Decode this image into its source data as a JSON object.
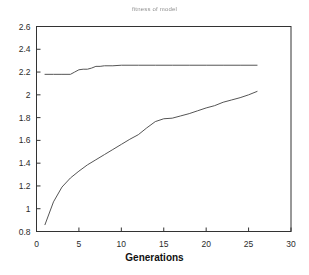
{
  "chart_data": {
    "type": "line",
    "title": "fitness of model",
    "xlabel": "Generations",
    "ylabel": "",
    "xlim": [
      0,
      30
    ],
    "ylim": [
      0.8,
      2.6
    ],
    "xticks": [
      0,
      5,
      10,
      15,
      20,
      25,
      30
    ],
    "yticks": [
      0.8,
      1,
      1.2,
      1.4,
      1.6,
      1.8,
      2,
      2.2,
      2.4,
      2.6
    ],
    "grid": false,
    "legend": null,
    "line_color": "#555555",
    "frame_color": "#333333",
    "background": "#ffffff",
    "series": [
      {
        "name": "best fitness",
        "x": [
          1,
          2,
          3,
          4,
          4.5,
          5,
          5.5,
          6,
          6.5,
          7,
          7.5,
          8,
          9,
          10,
          12,
          14,
          16,
          18,
          20,
          22,
          24,
          26
        ],
        "values": [
          2.18,
          2.18,
          2.18,
          2.18,
          2.2,
          2.22,
          2.225,
          2.225,
          2.235,
          2.25,
          2.25,
          2.255,
          2.255,
          2.26,
          2.26,
          2.26,
          2.26,
          2.26,
          2.26,
          2.26,
          2.26,
          2.26
        ]
      },
      {
        "name": "average fitness",
        "x": [
          1,
          2,
          3,
          4,
          5,
          6,
          7,
          8,
          9,
          10,
          11,
          12,
          13,
          14,
          15,
          16,
          17,
          18,
          19,
          20,
          21,
          22,
          23,
          24,
          25,
          26
        ],
        "values": [
          0.86,
          1.06,
          1.19,
          1.27,
          1.33,
          1.385,
          1.43,
          1.475,
          1.52,
          1.565,
          1.61,
          1.65,
          1.71,
          1.765,
          1.79,
          1.795,
          1.815,
          1.835,
          1.86,
          1.885,
          1.905,
          1.935,
          1.955,
          1.975,
          2.0,
          2.03
        ]
      }
    ]
  },
  "axis": {
    "xtick_labels": [
      "0",
      "5",
      "10",
      "15",
      "20",
      "25",
      "30"
    ],
    "ytick_labels": [
      "0.8",
      "1",
      "1.2",
      "1.4",
      "1.6",
      "1.8",
      "2",
      "2.2",
      "2.4",
      "2.6"
    ]
  }
}
